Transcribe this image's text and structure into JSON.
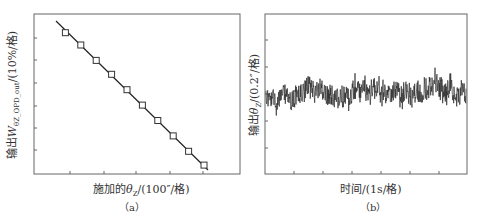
{
  "chart_data": [
    {
      "panel": "(a)",
      "type": "scatter",
      "caption": "(a)",
      "xlabel": "施加的θZ/(100″/格)",
      "ylabel": "输出WθZ_OPD_out/(10%/格)",
      "grid": false,
      "legend": null,
      "series": [
        {
          "name": "measured",
          "marker": "open-square",
          "x": [
            1,
            2,
            3,
            4,
            5,
            6,
            7,
            8,
            9,
            10
          ],
          "y": [
            9.5,
            8.7,
            7.7,
            6.8,
            5.8,
            4.8,
            3.8,
            2.8,
            1.8,
            0.9
          ]
        },
        {
          "name": "linear-fit",
          "type": "line",
          "x": [
            0.6,
            10.3
          ],
          "y": [
            10.1,
            0.6
          ]
        }
      ],
      "xticks_count": 5,
      "yticks_count": 6,
      "note": "Axes are in divisions (格); no numeric tick labels shown"
    },
    {
      "panel": "(b)",
      "type": "line",
      "caption": "(b)",
      "xlabel": "时间/(1s/格)",
      "ylabel": "输出θZ/(0.2″/格)",
      "grid": false,
      "legend": null,
      "series": [
        {
          "name": "output-noise",
          "description": "Noise signal fluctuating around center level (~3 divisions from bottom) with peak-to-peak ~2 divisions",
          "mean_level": 3.0,
          "range": [
            1.5,
            4.5
          ]
        }
      ],
      "xticks_count": 6,
      "yticks_count": 5,
      "note": "Axes are in divisions (格); no numeric tick labels shown"
    }
  ],
  "panels": {
    "a": {
      "xlabel_prefix": "施加的",
      "xlabel_var": "θ",
      "xlabel_sub": "Z",
      "xlabel_suffix": "/(100″/格)",
      "ylabel_prefix": "输出",
      "ylabel_var": "W",
      "ylabel_sub": "θZ_OPD_out",
      "ylabel_suffix": "/(10%/格)",
      "caption": "（a）"
    },
    "b": {
      "xlabel": "时间/(1s/格)",
      "ylabel_prefix": "输出",
      "ylabel_var": "θ",
      "ylabel_sub": "Z",
      "ylabel_suffix": "/(0.2″/格)",
      "caption": "（b）"
    }
  },
  "colors": {
    "axis": "#555555",
    "line": "#222222",
    "noise": "#2b2b2b"
  }
}
